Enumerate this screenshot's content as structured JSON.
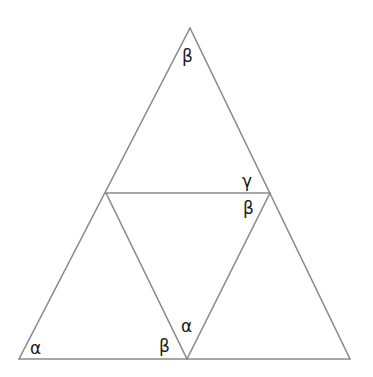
{
  "diagram": {
    "type": "geometry",
    "colors": {
      "line": "#8a8a8a",
      "text": "#1a1a1a",
      "background": "#ffffff"
    },
    "vertices": {
      "apex": [
        190,
        28
      ],
      "bottom_left": [
        19,
        359
      ],
      "bottom_right": [
        350,
        359
      ],
      "mid_left": [
        106,
        193
      ],
      "mid_right": [
        270,
        193
      ],
      "mid_bottom": [
        187,
        359
      ]
    },
    "labels": {
      "apex_beta": "β",
      "mid_right_gamma": "γ",
      "mid_right_beta": "β",
      "bottom_left_alpha": "α",
      "mid_bottom_beta": "β",
      "mid_bottom_alpha": "α"
    }
  }
}
